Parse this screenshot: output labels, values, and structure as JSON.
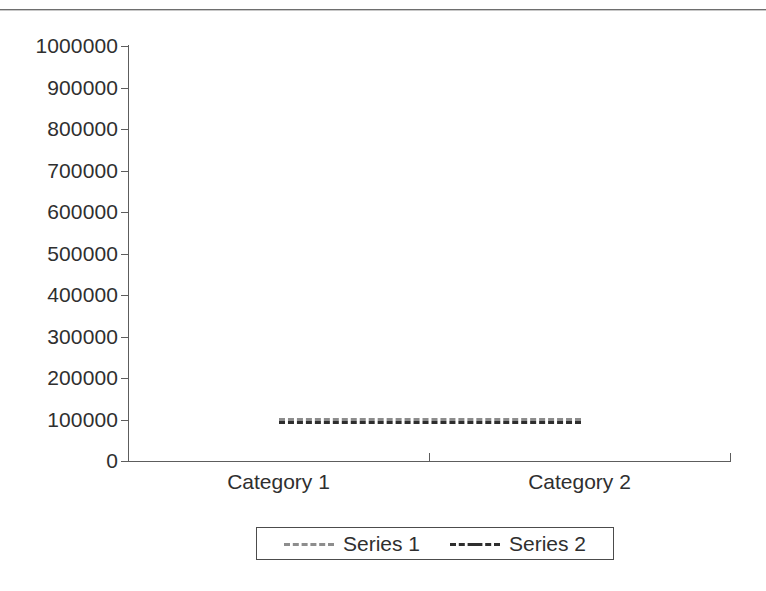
{
  "page": {
    "background_color": "#ffffff",
    "rule_color": "#6e6e6e"
  },
  "chart_data": {
    "type": "line",
    "title": "",
    "subtitle": "",
    "xlabel": "",
    "ylabel": "",
    "categories": [
      "Category 1",
      "Category 2"
    ],
    "series": [
      {
        "name": "Series 1",
        "values": [
          100000,
          100000
        ],
        "line_style": "dashed",
        "color": "#8d8d8d"
      },
      {
        "name": "Series 2",
        "values": [
          100000,
          100000
        ],
        "line_style": "dash-dot",
        "color": "#2e2e2e"
      }
    ],
    "ylim": [
      0,
      1000000
    ],
    "ytick_step": 100000,
    "yticks": [
      "1000000",
      "900000",
      "800000",
      "700000",
      "600000",
      "500000",
      "400000",
      "300000",
      "200000",
      "100000",
      "0"
    ],
    "grid": false,
    "legend_position": "bottom",
    "legend_entries": [
      "Series 1",
      "Series 2"
    ],
    "axis_color": "#5d5d5d",
    "text_color": "#2f2f2f"
  }
}
